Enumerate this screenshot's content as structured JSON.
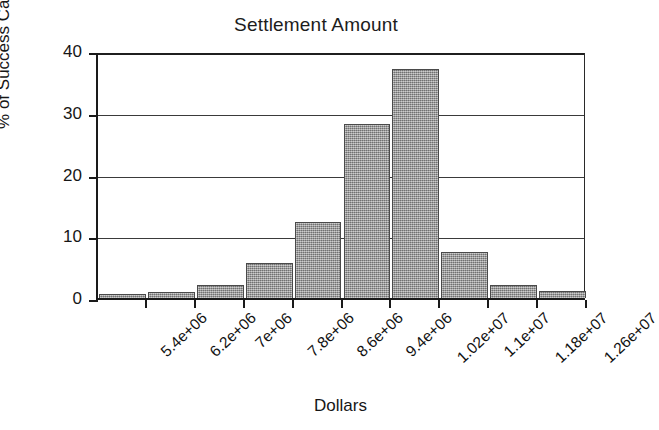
{
  "chart_data": {
    "type": "bar",
    "title": "Settlement Amount",
    "xlabel": "Dollars",
    "ylabel": "% of Success Cases",
    "categories": [
      "5.4e+06",
      "6.2e+06",
      "7e+06",
      "7.8e+06",
      "8.6e+06",
      "9.4e+06",
      "1.02e+07",
      "1.1e+07",
      "1.18e+07",
      "1.26e+07"
    ],
    "values": [
      0.6,
      1.0,
      2.1,
      5.6,
      12.3,
      28.2,
      37.1,
      7.5,
      2.1,
      1.1
    ],
    "ylim": [
      0,
      40
    ],
    "yticks": [
      0,
      10,
      20,
      30,
      40
    ],
    "ytick_labels": [
      "0",
      "10",
      "20",
      "30",
      "40"
    ],
    "grid": true,
    "grid_axis": "y",
    "legend": false,
    "legend_position": "none",
    "bar_color": "#9d9d9d",
    "bar_edge_color": "#4a4a4a",
    "axis_color": "#1a1a1a",
    "background_color": "#ffffff",
    "xtick_label_rotation": -43
  }
}
